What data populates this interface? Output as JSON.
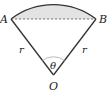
{
  "diagram": {
    "type": "circular-sector",
    "labels": {
      "A": "A",
      "B": "B",
      "O": "O",
      "r_left": "r",
      "r_right": "r",
      "theta": "θ"
    },
    "points": {
      "A": [
        11,
        19
      ],
      "B": [
        96,
        19
      ],
      "O": [
        53.5,
        75
      ]
    },
    "colors": {
      "stroke": "#333333",
      "shade": "#e3e3e3",
      "chord": "#666666",
      "angle_arc": "#aaaaaa"
    }
  }
}
